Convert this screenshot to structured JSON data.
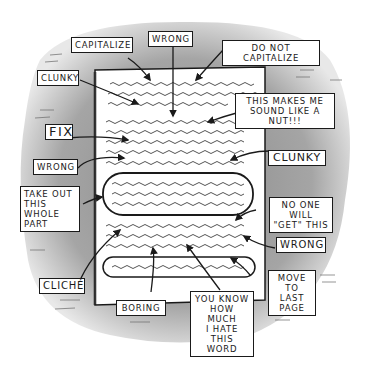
{
  "cartoon": {
    "subject": "Edited manuscript page covered with critical notes",
    "colors": {
      "background_blob": "#9a9a9a",
      "paper": "#ffffff",
      "ink": "#1a1a1a",
      "squiggle": "#555555"
    },
    "labels": [
      {
        "id": "capitalize",
        "text": "CAPITALIZE"
      },
      {
        "id": "wrong-top",
        "text": "WRONG"
      },
      {
        "id": "do-not-capitalize",
        "text": "DO NOT CAPITALIZE"
      },
      {
        "id": "clunky-left",
        "text": "CLUNKY"
      },
      {
        "id": "nut",
        "text": "THIS MAKES ME\nSOUND LIKE A NUT!!!"
      },
      {
        "id": "fix",
        "text": "FIX"
      },
      {
        "id": "wrong-left",
        "text": "WRONG"
      },
      {
        "id": "clunky-right",
        "text": "CLUNKY"
      },
      {
        "id": "take-out",
        "text": "TAKE OUT\nTHIS WHOLE\nPART"
      },
      {
        "id": "no-one",
        "text": "NO ONE WILL\n\"GET\" THIS"
      },
      {
        "id": "wrong-right",
        "text": "WRONG"
      },
      {
        "id": "cliche",
        "text": "CLICHÉ"
      },
      {
        "id": "move",
        "text": "MOVE TO\nLAST\nPAGE"
      },
      {
        "id": "boring",
        "text": "BORING"
      },
      {
        "id": "hate",
        "text": "YOU KNOW\nHOW MUCH\nI HATE\nTHIS WORD"
      }
    ]
  }
}
